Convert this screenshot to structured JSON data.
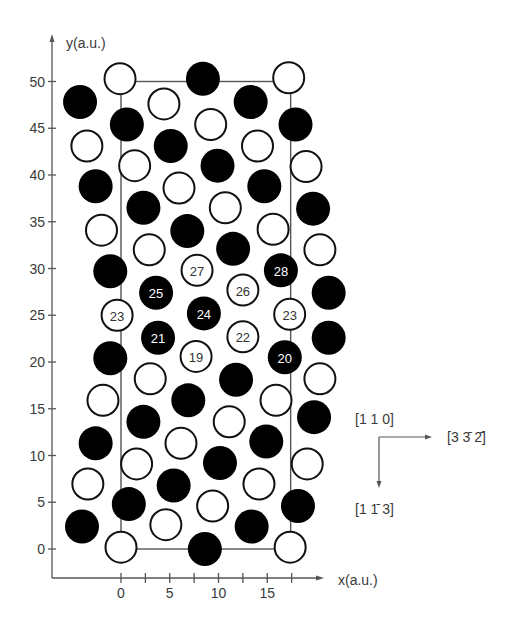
{
  "figure": {
    "x_axis": {
      "label": "x(a.u.)",
      "ticks": [
        {
          "value": 0,
          "label": "0"
        },
        {
          "value": 2.5,
          "label": ""
        },
        {
          "value": 5,
          "label": "5"
        },
        {
          "value": 7.5,
          "label": ""
        },
        {
          "value": 10,
          "label": "10"
        },
        {
          "value": 12.5,
          "label": ""
        },
        {
          "value": 15,
          "label": "15"
        },
        {
          "value": 17.5,
          "label": ""
        }
      ]
    },
    "y_axis": {
      "label": "y(a.u.)",
      "ticks": [
        {
          "value": 0,
          "label": "0"
        },
        {
          "value": 5,
          "label": "5"
        },
        {
          "value": 10,
          "label": "10"
        },
        {
          "value": 15,
          "label": "15"
        },
        {
          "value": 20,
          "label": "20"
        },
        {
          "value": 25,
          "label": "25"
        },
        {
          "value": 30,
          "label": "30"
        },
        {
          "value": 35,
          "label": "35"
        },
        {
          "value": 40,
          "label": "40"
        },
        {
          "value": 45,
          "label": "45"
        },
        {
          "value": 50,
          "label": "50"
        }
      ]
    },
    "unit_cell": {
      "x0": 0,
      "y0": 0,
      "x1": 17.4,
      "y1": 50
    },
    "orientation_legend": {
      "normal": "[1 1 0]",
      "horizontal": "[3 3̄ 2̄]",
      "vertical": "[1 1̄ 3]"
    },
    "colors": {
      "filled": "#000000",
      "open_fill": "#ffffff",
      "stroke": "#111111",
      "axis": "#555555",
      "cell": "#555555"
    }
  },
  "atoms": [
    {
      "x": -0.1,
      "y": 50.3,
      "filled": false
    },
    {
      "x": 8.4,
      "y": 50.3,
      "filled": true
    },
    {
      "x": 17.2,
      "y": 50.4,
      "filled": false
    },
    {
      "x": -4.2,
      "y": 47.8,
      "filled": true
    },
    {
      "x": 4.4,
      "y": 47.6,
      "filled": false
    },
    {
      "x": 13.3,
      "y": 47.8,
      "filled": true
    },
    {
      "x": 0.6,
      "y": 45.4,
      "filled": true
    },
    {
      "x": 9.2,
      "y": 45.4,
      "filled": false
    },
    {
      "x": 17.9,
      "y": 45.4,
      "filled": true
    },
    {
      "x": -3.5,
      "y": 43.1,
      "filled": false
    },
    {
      "x": 5.1,
      "y": 43.1,
      "filled": true
    },
    {
      "x": 14.0,
      "y": 43.1,
      "filled": false
    },
    {
      "x": 1.4,
      "y": 41.0,
      "filled": false
    },
    {
      "x": 9.9,
      "y": 41.0,
      "filled": true
    },
    {
      "x": 18.98,
      "y": 40.9,
      "filled": false
    },
    {
      "x": -2.6,
      "y": 38.8,
      "filled": true
    },
    {
      "x": 5.95,
      "y": 38.6,
      "filled": false
    },
    {
      "x": 14.7,
      "y": 38.8,
      "filled": true
    },
    {
      "x": 2.3,
      "y": 36.5,
      "filled": true
    },
    {
      "x": 10.7,
      "y": 36.5,
      "filled": false
    },
    {
      "x": 19.7,
      "y": 36.4,
      "filled": true
    },
    {
      "x": -2.0,
      "y": 34.1,
      "filled": false
    },
    {
      "x": 6.8,
      "y": 34.0,
      "filled": true
    },
    {
      "x": 15.6,
      "y": 34.2,
      "filled": false
    },
    {
      "x": 2.9,
      "y": 32.0,
      "filled": false
    },
    {
      "x": 11.5,
      "y": 32.1,
      "filled": true
    },
    {
      "x": 20.4,
      "y": 32.0,
      "filled": false
    },
    {
      "x": -1.1,
      "y": 29.7,
      "filled": true
    },
    {
      "x": 7.8,
      "y": 29.8,
      "filled": false,
      "label": "27"
    },
    {
      "x": 16.4,
      "y": 29.8,
      "filled": true,
      "label": "28"
    },
    {
      "x": 3.6,
      "y": 27.4,
      "filled": true,
      "label": "25"
    },
    {
      "x": 12.5,
      "y": 27.7,
      "filled": false,
      "label": "26"
    },
    {
      "x": 21.3,
      "y": 27.4,
      "filled": true
    },
    {
      "x": -0.4,
      "y": 25.0,
      "filled": false,
      "label": "23"
    },
    {
      "x": 8.5,
      "y": 25.2,
      "filled": true,
      "label": "24"
    },
    {
      "x": 17.3,
      "y": 25.1,
      "filled": false,
      "label": "23"
    },
    {
      "x": 3.8,
      "y": 22.6,
      "filled": true,
      "label": "21"
    },
    {
      "x": 12.5,
      "y": 22.7,
      "filled": false,
      "label": "22"
    },
    {
      "x": 21.3,
      "y": 22.6,
      "filled": true
    },
    {
      "x": -1.1,
      "y": 20.4,
      "filled": true
    },
    {
      "x": 7.7,
      "y": 20.6,
      "filled": false,
      "label": "19"
    },
    {
      "x": 16.8,
      "y": 20.5,
      "filled": true,
      "label": "20"
    },
    {
      "x": 3.0,
      "y": 18.2,
      "filled": false
    },
    {
      "x": 11.8,
      "y": 18.1,
      "filled": true
    },
    {
      "x": 20.4,
      "y": 18.2,
      "filled": false
    },
    {
      "x": -1.85,
      "y": 15.9,
      "filled": false
    },
    {
      "x": 6.9,
      "y": 15.9,
      "filled": true
    },
    {
      "x": 15.9,
      "y": 15.9,
      "filled": false
    },
    {
      "x": 2.3,
      "y": 13.6,
      "filled": true
    },
    {
      "x": 11.1,
      "y": 13.6,
      "filled": false
    },
    {
      "x": 19.8,
      "y": 14.1,
      "filled": true
    },
    {
      "x": -2.6,
      "y": 11.3,
      "filled": true
    },
    {
      "x": 6.15,
      "y": 11.3,
      "filled": false
    },
    {
      "x": 14.9,
      "y": 11.5,
      "filled": true
    },
    {
      "x": 1.6,
      "y": 9.1,
      "filled": false
    },
    {
      "x": 10.15,
      "y": 9.2,
      "filled": true
    },
    {
      "x": 19.1,
      "y": 9.1,
      "filled": false
    },
    {
      "x": -3.4,
      "y": 6.95,
      "filled": false
    },
    {
      "x": 5.4,
      "y": 6.8,
      "filled": true
    },
    {
      "x": 14.15,
      "y": 6.95,
      "filled": false
    },
    {
      "x": 0.8,
      "y": 4.8,
      "filled": true
    },
    {
      "x": 9.4,
      "y": 4.6,
      "filled": false
    },
    {
      "x": 18.15,
      "y": 4.6,
      "filled": true
    },
    {
      "x": -4.0,
      "y": 2.4,
      "filled": true
    },
    {
      "x": 4.6,
      "y": 2.6,
      "filled": false
    },
    {
      "x": 13.4,
      "y": 2.4,
      "filled": true
    },
    {
      "x": 0.0,
      "y": 0.2,
      "filled": false
    },
    {
      "x": 8.6,
      "y": 0.0,
      "filled": true
    },
    {
      "x": 17.35,
      "y": 0.2,
      "filled": false
    }
  ]
}
